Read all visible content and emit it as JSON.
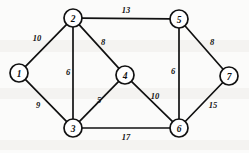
{
  "figure": {
    "background_color": "#fbfbfa",
    "line_color": "#111111",
    "node_fill_color": "#ffffff",
    "width": 249,
    "height": 153
  },
  "chart_data": {
    "type": "diagram",
    "diagram_kind": "weighted-undirected-graph",
    "title": "",
    "node_radius": 9,
    "nodes": [
      {
        "id": "1",
        "label": "1",
        "x": 19,
        "y": 73
      },
      {
        "id": "2",
        "label": "2",
        "x": 73,
        "y": 18
      },
      {
        "id": "3",
        "label": "3",
        "x": 73,
        "y": 128
      },
      {
        "id": "4",
        "label": "4",
        "x": 125,
        "y": 75
      },
      {
        "id": "5",
        "label": "5",
        "x": 179,
        "y": 19
      },
      {
        "id": "6",
        "label": "6",
        "x": 179,
        "y": 128
      },
      {
        "id": "7",
        "label": "7",
        "x": 229,
        "y": 76
      }
    ],
    "edges": [
      {
        "from": "1",
        "to": "2",
        "weight": 10,
        "label": "10",
        "lx": 37,
        "ly": 38
      },
      {
        "from": "1",
        "to": "3",
        "weight": 9,
        "label": "9",
        "lx": 38,
        "ly": 105
      },
      {
        "from": "2",
        "to": "3",
        "weight": 6,
        "label": "6",
        "lx": 68,
        "ly": 72
      },
      {
        "from": "2",
        "to": "4",
        "weight": 8,
        "label": "8",
        "lx": 103,
        "ly": 42
      },
      {
        "from": "2",
        "to": "5",
        "weight": 13,
        "label": "13",
        "lx": 126,
        "ly": 10
      },
      {
        "from": "3",
        "to": "4",
        "weight": 5,
        "label": "5",
        "lx": 99,
        "ly": 100
      },
      {
        "from": "3",
        "to": "6",
        "weight": 17,
        "label": "17",
        "lx": 126,
        "ly": 137
      },
      {
        "from": "4",
        "to": "6",
        "weight": 10,
        "label": "10",
        "lx": 155,
        "ly": 96
      },
      {
        "from": "5",
        "to": "6",
        "weight": 6,
        "label": "6",
        "lx": 173,
        "ly": 71
      },
      {
        "from": "5",
        "to": "7",
        "weight": 8,
        "label": "8",
        "lx": 212,
        "ly": 42
      },
      {
        "from": "6",
        "to": "7",
        "weight": 15,
        "label": "15",
        "lx": 213,
        "ly": 105
      }
    ]
  }
}
